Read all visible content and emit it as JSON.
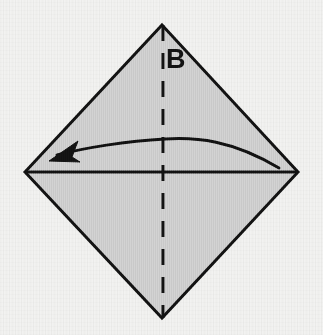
{
  "figure": {
    "canvas": {
      "width": 323,
      "height": 335
    },
    "background_color": "#f0f0ee",
    "shape": {
      "name": "diamond-square",
      "fill_color": "#c9c9c9",
      "stroke_color": "#111111",
      "stroke_width": 3,
      "vertices": {
        "top": [
          162,
          25
        ],
        "right": [
          298,
          172
        ],
        "bottom": [
          162,
          318
        ],
        "left": [
          25,
          172
        ]
      }
    },
    "horizontal_crease": {
      "name": "horizontal-diagonal-line",
      "from": [
        25,
        172
      ],
      "to": [
        298,
        172
      ],
      "stroke_color": "#111111",
      "stroke_width": 3,
      "style": "solid"
    },
    "vertical_crease": {
      "name": "vertical-dashed-fold-line",
      "from": [
        163,
        25
      ],
      "to": [
        163,
        318
      ],
      "stroke_color": "#111111",
      "stroke_width": 3,
      "style": "dashed",
      "dash_pattern": "16 12"
    },
    "fold_arrow": {
      "name": "fold-direction-arrow",
      "direction": "right-to-left",
      "start": [
        279,
        168
      ],
      "apex": [
        165,
        139
      ],
      "end": [
        52,
        156
      ],
      "stroke_color": "#111111",
      "stroke_width": 3,
      "arrowhead_fill": "#111111"
    },
    "labels": [
      {
        "id": "B",
        "text": "B",
        "x": 166,
        "y": 68,
        "color": "#111111"
      }
    ]
  }
}
